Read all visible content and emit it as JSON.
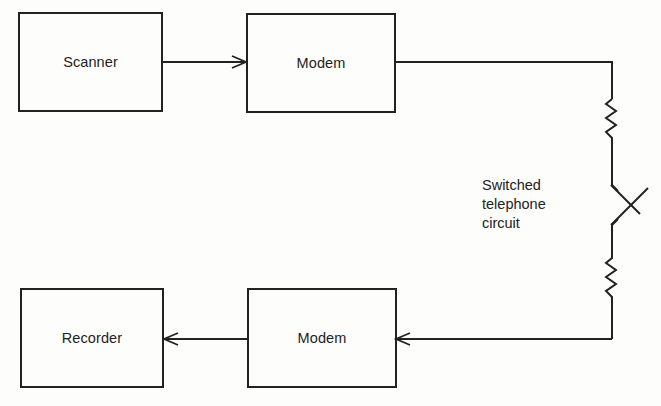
{
  "diagram": {
    "type": "block-diagram",
    "blocks": [
      {
        "id": "scanner",
        "label": "Scanner"
      },
      {
        "id": "modem_tx",
        "label": "Modem"
      },
      {
        "id": "recorder",
        "label": "Recorder"
      },
      {
        "id": "modem_rx",
        "label": "Modem"
      }
    ],
    "channel": {
      "label_lines": [
        "Switched",
        "telephone",
        "circuit"
      ]
    },
    "connections": [
      {
        "from": "scanner",
        "to": "modem_tx",
        "arrow": true
      },
      {
        "from": "modem_tx",
        "to": "channel",
        "arrow": false
      },
      {
        "from": "channel",
        "to": "modem_rx",
        "arrow": true
      },
      {
        "from": "modem_rx",
        "to": "recorder",
        "arrow": true
      }
    ],
    "colors": {
      "line": "#222222",
      "background": "#fdfdfc"
    }
  }
}
